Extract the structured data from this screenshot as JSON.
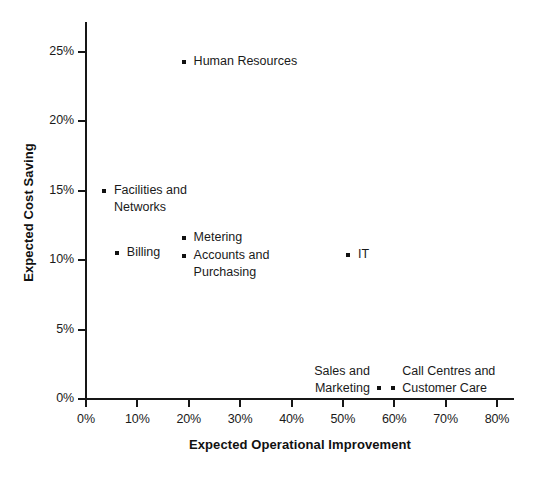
{
  "chart_data": {
    "type": "scatter",
    "title": "",
    "xlabel": "Expected Operational Improvement",
    "ylabel": "Expected Cost Saving",
    "xlim": [
      0,
      80
    ],
    "ylim": [
      0,
      26
    ],
    "grid": false,
    "legend": "none",
    "x_ticks": [
      "0%",
      "10%",
      "20%",
      "30%",
      "40%",
      "50%",
      "60%",
      "70%",
      "80%"
    ],
    "x_tick_values": [
      0,
      10,
      20,
      30,
      40,
      50,
      60,
      70,
      80
    ],
    "y_ticks": [
      "0%",
      "5%",
      "10%",
      "15%",
      "20%",
      "25%"
    ],
    "y_tick_values": [
      0,
      5,
      10,
      15,
      20,
      25
    ],
    "points": [
      {
        "label": "Human Resources",
        "x": 19.0,
        "y": 24.3,
        "label_align": "left",
        "label_dx": 10,
        "label_dy": -9
      },
      {
        "label": "Facilities and\nNetworks",
        "x": 3.5,
        "y": 15.0,
        "label_align": "left",
        "label_dx": 10,
        "label_dy": -9
      },
      {
        "label": "Metering",
        "x": 19.0,
        "y": 11.6,
        "label_align": "left",
        "label_dx": 10,
        "label_dy": -9
      },
      {
        "label": "Billing",
        "x": 6.0,
        "y": 10.5,
        "label_align": "left",
        "label_dx": 10,
        "label_dy": -9
      },
      {
        "label": "Accounts and\nPurchasing",
        "x": 19.0,
        "y": 10.3,
        "label_align": "left",
        "label_dx": 10,
        "label_dy": -9
      },
      {
        "label": "IT",
        "x": 51.0,
        "y": 10.4,
        "label_align": "left",
        "label_dx": 10,
        "label_dy": -9
      },
      {
        "label": "Sales and\nMarketing",
        "x": 57.0,
        "y": 0.8,
        "label_align": "right",
        "label_dx": -9,
        "label_dy": -25
      },
      {
        "label": "Call Centres and\nCustomer Care",
        "x": 59.8,
        "y": 0.8,
        "label_align": "left",
        "label_dx": 9,
        "label_dy": -25
      }
    ]
  },
  "colors": {
    "point": "#111111",
    "axis": "#161616",
    "text": "#1a1a1a",
    "background": "#ffffff"
  }
}
